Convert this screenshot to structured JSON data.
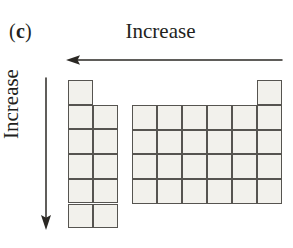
{
  "figure": {
    "panel_letter": "(c)",
    "panel_letter_prefix": "(",
    "panel_letter_char": "c",
    "panel_letter_suffix": ")",
    "top_axis_label": "Increase",
    "left_axis_label": "Increase",
    "background_color": "#ffffff",
    "cell_fill_color": "#f2f1ec",
    "cell_border_color": "#565450",
    "arrow_color": "#2b2824"
  },
  "arrows": {
    "top": {
      "name": "horizontal-increase-arrow",
      "direction": "left",
      "x_start": 282,
      "x_end": 68,
      "y": 60
    },
    "left": {
      "name": "vertical-increase-arrow",
      "direction": "down",
      "x": 46,
      "y_start": 78,
      "y_end": 228
    }
  },
  "chart_data": {
    "type": "table",
    "cell_width": 25,
    "cell_height": 24.7,
    "blocks": [
      {
        "name": "left-block",
        "origin_x": 68,
        "origin_y": 80,
        "columns": 2,
        "column_heights": [
          6,
          5
        ],
        "column_top_offsets": [
          0,
          1
        ]
      },
      {
        "name": "right-block",
        "origin_x": 132,
        "origin_y": 105,
        "columns": 6,
        "column_heights": [
          4,
          4,
          4,
          4,
          4,
          5
        ],
        "column_top_offsets": [
          0,
          0,
          0,
          0,
          0,
          -1
        ]
      }
    ]
  }
}
